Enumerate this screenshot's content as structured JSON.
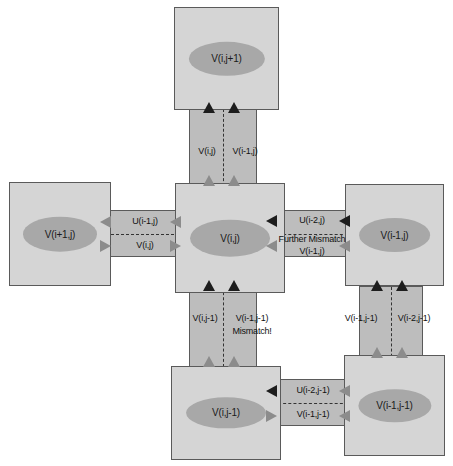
{
  "diagram": {
    "colors": {
      "background": "#ffffff",
      "pe_fill": "#d5d5d5",
      "pe_stroke": "#5a5a5a",
      "ellipse_fill": "#a8a8a8",
      "channel_fill": "#bdbdbd",
      "arrow_dark": "#1d1d1d",
      "arrow_gray": "#8c8c8c",
      "text": "#111111"
    },
    "cells": {
      "top_center": "V(i,j+1)",
      "middle_left": "V(i+1,j)",
      "middle_center": "V(i,j)",
      "middle_right": "V(i-1,j)",
      "bottom_center": "V(i,j-1)",
      "bottom_right": "V(i-1,j-1)"
    },
    "channels": {
      "top_vertical": {
        "left_label": "V(i,j)",
        "right_label": "V(i-1,j)"
      },
      "left_horizontal": {
        "upper_label": "U(i-1,j)",
        "lower_label": "V(i,j)"
      },
      "right_horizontal": {
        "upper_label": "U(i-2,j)",
        "note": "Further Mismatch",
        "lower_label": "V(i-1,j)"
      },
      "bottom_center_vertical": {
        "left_label": "V(i,j-1)",
        "right_label": "V(i-1,j-1)",
        "note": "Mismatch!"
      },
      "bottom_right_vertical": {
        "left_label": "V(i-1,j-1)",
        "right_label": "V(i-2,j-1)"
      },
      "bottom_horizontal": {
        "upper_label": "U(i-2,j-1)",
        "lower_label": "V(i-1,j-1)"
      }
    }
  }
}
